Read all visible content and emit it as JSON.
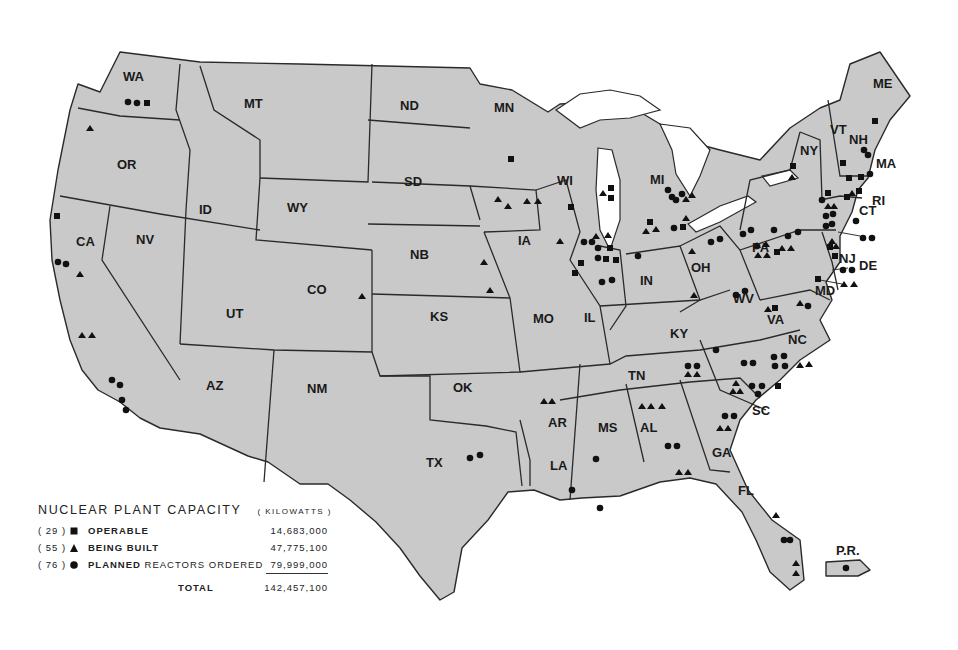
{
  "map": {
    "subject": "Nuclear power plants in the United States",
    "state_labels": [
      "WA",
      "OR",
      "CA",
      "NV",
      "ID",
      "MT",
      "WY",
      "UT",
      "AZ",
      "CO",
      "NM",
      "ND",
      "SD",
      "NB",
      "KS",
      "OK",
      "TX",
      "MN",
      "IA",
      "MO",
      "AR",
      "LA",
      "WI",
      "IL",
      "MI",
      "IN",
      "OH",
      "KY",
      "TN",
      "MS",
      "AL",
      "GA",
      "FL",
      "SC",
      "NC",
      "VA",
      "WV",
      "PA",
      "NY",
      "VT",
      "NH",
      "ME",
      "MA",
      "RI",
      "CT",
      "NJ",
      "DE",
      "MD",
      "P.R."
    ]
  },
  "legend": {
    "title": "NUCLEAR PLANT CAPACITY",
    "unit": "( KILOWATTS )",
    "rows": [
      {
        "count": "( 29 )",
        "symbol": "square",
        "label": "OPERABLE",
        "label_extra": "",
        "value": "14,683,000"
      },
      {
        "count": "( 55 )",
        "symbol": "triangle",
        "label": "BEING BUILT",
        "label_extra": "",
        "value": "47,775,100"
      },
      {
        "count": "( 76 )",
        "symbol": "circle",
        "label": "PLANNED",
        "label_extra": " REACTORS ORDERED",
        "value": "79,999,000"
      }
    ],
    "total_label": "TOTAL",
    "total_value": "142,457,100"
  }
}
